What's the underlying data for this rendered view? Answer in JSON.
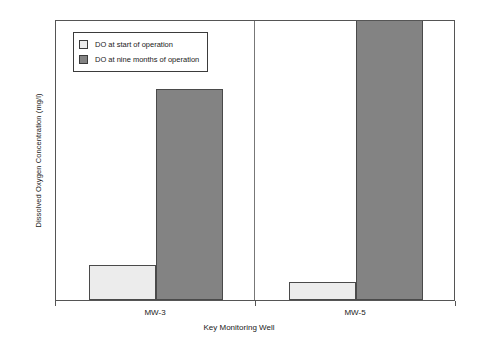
{
  "chart_data": {
    "type": "bar",
    "title": "",
    "subtitle": "",
    "xlabel": "Key Monitoring Well",
    "ylabel": "Dissolved Oxygen Concentration (mg/l)",
    "categories": [
      "MW-3",
      "MW-5"
    ],
    "series": [
      {
        "name": "DO at start of operation",
        "values": [
          0.1,
          0.05
        ],
        "color": "#ececec"
      },
      {
        "name": "DO at nine months of operation",
        "values": [
          0.6,
          0.8
        ],
        "color": "#838383"
      }
    ],
    "ylim": [
      0,
      0.8
    ],
    "yticks": [
      0,
      0.1,
      0.2,
      0.3,
      0.4,
      0.5,
      0.6,
      0.7,
      0.8
    ],
    "ytick_labels": [
      "0",
      "0.1",
      "0.2",
      "0.3",
      "0.4",
      "0.5",
      "0.6",
      "0.7",
      "0.8"
    ],
    "grid": false,
    "legend_position": "upper left"
  },
  "legend": {
    "entries": [
      {
        "label": "DO at start of operation",
        "swatch": "light-gray-swatch"
      },
      {
        "label": "DO at nine months of operation",
        "swatch": "dark-gray-swatch"
      }
    ]
  },
  "axes": {
    "y_title": "Dissolved Oxygen Concentration (mg/l)",
    "x_title": "Key Monitoring Well"
  }
}
